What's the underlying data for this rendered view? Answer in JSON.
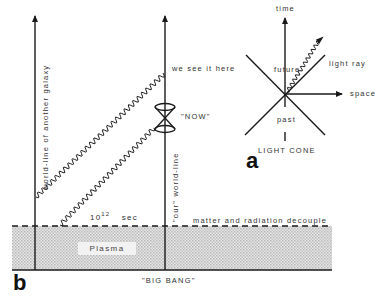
{
  "diagram_b": {
    "panel_label": "b",
    "galaxy_worldline_label": "world-line of another galaxy",
    "our_worldline_label": "\"our\" world-line",
    "we_see_label": "we see it here",
    "now_label": "\"NOW\"",
    "time_base": "10",
    "time_exponent": "12",
    "time_unit": "sec",
    "decouple_label": "matter and radiation decouple",
    "plasma_label": "Plasma",
    "big_bang_label": "\"BIG BANG\""
  },
  "diagram_a": {
    "panel_label": "a",
    "title": "LIGHT CONE",
    "time_label": "time",
    "space_label": "space",
    "future_label": "future",
    "past_label": "past",
    "light_ray_label": "light ray"
  },
  "colors": {
    "ink": "#1a1a1a",
    "text": "#333333",
    "plasma_fill": "#d9d9d9"
  }
}
